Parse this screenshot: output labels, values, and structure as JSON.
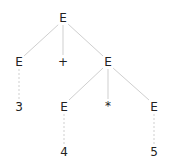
{
  "diagram": {
    "type": "parse-tree",
    "nodes": [
      {
        "id": "n0",
        "label": "E",
        "x": 63,
        "y": 18
      },
      {
        "id": "n1",
        "label": "E",
        "x": 19,
        "y": 62
      },
      {
        "id": "n2",
        "label": "+",
        "x": 63,
        "y": 62
      },
      {
        "id": "n3",
        "label": "E",
        "x": 108,
        "y": 62
      },
      {
        "id": "n4",
        "label": "3",
        "x": 19,
        "y": 107
      },
      {
        "id": "n5",
        "label": "E",
        "x": 64,
        "y": 107
      },
      {
        "id": "n6",
        "label": "*",
        "x": 108,
        "y": 106
      },
      {
        "id": "n7",
        "label": "E",
        "x": 154,
        "y": 107
      },
      {
        "id": "n8",
        "label": "4",
        "x": 64,
        "y": 152
      },
      {
        "id": "n9",
        "label": "5",
        "x": 154,
        "y": 152
      }
    ],
    "edges": [
      {
        "from": "n0",
        "to": "n1",
        "style": "solid"
      },
      {
        "from": "n0",
        "to": "n2",
        "style": "solid"
      },
      {
        "from": "n0",
        "to": "n3",
        "style": "solid"
      },
      {
        "from": "n1",
        "to": "n4",
        "style": "dashed"
      },
      {
        "from": "n3",
        "to": "n5",
        "style": "solid"
      },
      {
        "from": "n3",
        "to": "n6",
        "style": "solid"
      },
      {
        "from": "n3",
        "to": "n7",
        "style": "solid"
      },
      {
        "from": "n5",
        "to": "n8",
        "style": "dashed"
      },
      {
        "from": "n7",
        "to": "n9",
        "style": "dashed"
      }
    ],
    "colors": {
      "edge": "#cccccc",
      "text": "#222222"
    }
  }
}
